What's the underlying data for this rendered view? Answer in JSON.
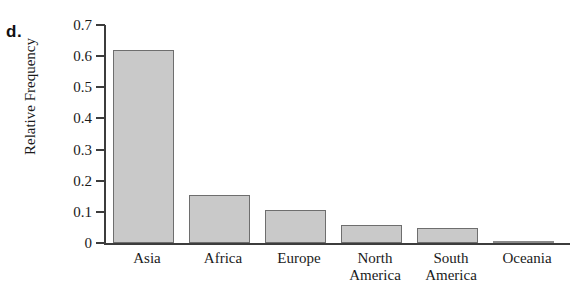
{
  "panel": {
    "label": "d."
  },
  "chart_data": {
    "type": "bar",
    "title": "",
    "xlabel": "",
    "ylabel": "Relative Frequency",
    "categories": [
      "Asia",
      "Africa",
      "Europe",
      "North America",
      "South America",
      "Oceania"
    ],
    "category_lines": [
      [
        "Asia"
      ],
      [
        "Africa"
      ],
      [
        "Europe"
      ],
      [
        "North",
        "America"
      ],
      [
        "South",
        "America"
      ],
      [
        "Oceania"
      ]
    ],
    "values": [
      0.62,
      0.155,
      0.107,
      0.057,
      0.048,
      0.005
    ],
    "ylim": [
      0,
      0.7
    ],
    "ytick_values": [
      0,
      0.1,
      0.2,
      0.3,
      0.4,
      0.5,
      0.6,
      0.7
    ],
    "ytick_labels": [
      "0",
      "0.1",
      "0.2",
      "0.3",
      "0.4",
      "0.5",
      "0.6",
      "0.7"
    ],
    "grid": false,
    "legend": "none",
    "bar_fill_color": "#c9c9c9",
    "bar_border_color": "#6e6e6e",
    "axis_color": "#3c3c3c"
  }
}
